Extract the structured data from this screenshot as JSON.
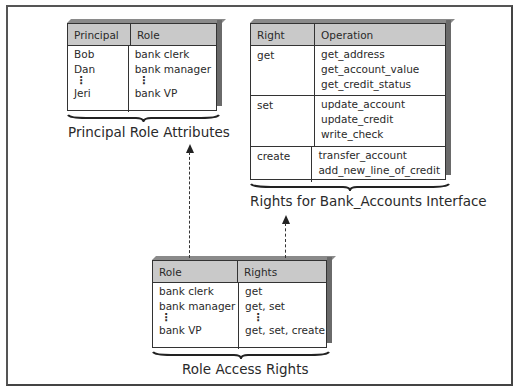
{
  "principal_role_table": {
    "headers": [
      "Principal",
      "Role"
    ],
    "rows": [
      {
        "principal": "Bob",
        "role": "bank clerk"
      },
      {
        "principal": "Dan",
        "role": "bank manager"
      },
      {
        "principal": "⋮",
        "role": "⋮"
      },
      {
        "principal": "Jeri",
        "role": "bank VP"
      }
    ],
    "caption": "Principal Role Attributes"
  },
  "rights_table": {
    "headers": [
      "Right",
      "Operation"
    ],
    "groups": [
      {
        "right": "get",
        "operations": [
          "get_address",
          "get_account_value",
          "get_credit_status"
        ]
      },
      {
        "right": "set",
        "operations": [
          "update_account",
          "update_credit",
          "write_check"
        ]
      },
      {
        "right": "create",
        "operations": [
          "transfer_account",
          "add_new_line_of_credit"
        ]
      }
    ],
    "caption": "Rights for Bank_Accounts Interface"
  },
  "role_rights_table": {
    "headers": [
      "Role",
      "Rights"
    ],
    "rows": [
      {
        "role": "bank clerk",
        "rights": "get"
      },
      {
        "role": "bank manager",
        "rights": "get, set"
      },
      {
        "role": "⋮",
        "rights": "⋮"
      },
      {
        "role": "bank VP",
        "rights": "get, set, create"
      }
    ],
    "caption": "Role Access Rights"
  },
  "arrows": [
    {
      "from": "Role Access Rights",
      "to": "Principal Role Attributes",
      "style": "dashed"
    },
    {
      "from": "Role Access Rights",
      "to": "Rights for Bank_Accounts Interface",
      "style": "dashed"
    }
  ],
  "colors": {
    "header_fill": "#c9c9c9",
    "line": "#333333",
    "background": "#ffffff"
  }
}
